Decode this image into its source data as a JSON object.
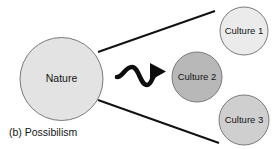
{
  "figure": {
    "caption": "(b) Possibilism",
    "background_color": "#ffffff"
  },
  "nodes": {
    "source": {
      "label": "Nature",
      "fill": "#e3e3e3",
      "stroke": "#7a7a7a",
      "cx": 61.5,
      "cy": 79,
      "r": 41.5
    },
    "targets": [
      {
        "label": "Culture 1",
        "fill": "#ebebeb",
        "stroke": "#7a7a7a",
        "cx": 244,
        "cy": 31,
        "r": 24
      },
      {
        "label": "Culture 2",
        "fill": "#b8b8b8",
        "stroke": "#7a7a7a",
        "cx": 197,
        "cy": 77,
        "r": 25
      },
      {
        "label": "Culture 3",
        "fill": "#cfcfcf",
        "stroke": "#7a7a7a",
        "cx": 244,
        "cy": 120,
        "r": 25
      }
    ]
  },
  "connectors": {
    "divergence_color": "#121212",
    "top_line": {
      "x1": 98,
      "y1": 52,
      "x2": 215,
      "y2": 11
    },
    "bottom_line": {
      "x1": 98,
      "y1": 100,
      "x2": 219,
      "y2": 143
    },
    "wave_arrow": {
      "name": "squiggly-arrow",
      "color": "#0d0d0d",
      "path": "M 117 77 C 123 77, 125 67, 132 67 C 139 67, 140 85, 147 85 C 152 85, 153 73, 157 72",
      "arrow_points": "151,63 165,71.5 151,80"
    }
  },
  "colors": {
    "ink": "#121212",
    "light_gray": "#e3e3e3",
    "mid_gray": "#b8b8b8",
    "pale_gray": "#ebebeb",
    "soft_gray": "#cfcfcf"
  }
}
